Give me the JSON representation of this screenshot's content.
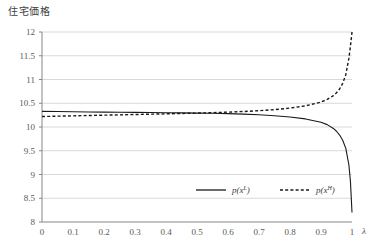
{
  "chart_data": {
    "type": "line",
    "title": "住宅価格",
    "xlabel": "λ",
    "ylabel": "",
    "xlim": [
      0,
      1
    ],
    "ylim": [
      8,
      12
    ],
    "grid": true,
    "legend_position": "inside-bottom-center",
    "x_ticks": [
      "0",
      "0.1",
      "0.2",
      "0.3",
      "0.4",
      "0.5",
      "0.6",
      "0.7",
      "0.8",
      "0.9",
      "1"
    ],
    "y_ticks": [
      "8",
      "8.5",
      "9",
      "9.5",
      "10",
      "10.5",
      "11",
      "11.5",
      "12"
    ],
    "x": [
      0,
      0.05,
      0.1,
      0.15,
      0.2,
      0.25,
      0.3,
      0.35,
      0.4,
      0.45,
      0.5,
      0.55,
      0.6,
      0.65,
      0.7,
      0.75,
      0.8,
      0.85,
      0.9,
      0.92,
      0.94,
      0.95,
      0.96,
      0.97,
      0.98,
      0.99,
      0.995,
      1
    ],
    "series": [
      {
        "name": "p(x^L)",
        "legend_base": "p(x",
        "legend_sup": "L",
        "style": "solid",
        "color": "#1a1a1a",
        "values": [
          10.33,
          10.325,
          10.32,
          10.317,
          10.313,
          10.31,
          10.307,
          10.304,
          10.3,
          10.297,
          10.293,
          10.288,
          10.282,
          10.272,
          10.258,
          10.238,
          10.21,
          10.17,
          10.1,
          10.05,
          9.97,
          9.91,
          9.83,
          9.72,
          9.55,
          9.2,
          8.85,
          8.2
        ]
      },
      {
        "name": "p(x^H)",
        "legend_base": "p(x",
        "legend_sup": "H",
        "style": "dashed",
        "color": "#1a1a1a",
        "values": [
          10.22,
          10.228,
          10.235,
          10.242,
          10.249,
          10.256,
          10.263,
          10.27,
          10.277,
          10.285,
          10.293,
          10.302,
          10.313,
          10.326,
          10.343,
          10.366,
          10.398,
          10.445,
          10.525,
          10.58,
          10.66,
          10.72,
          10.8,
          10.92,
          11.1,
          11.45,
          11.7,
          12.0
        ]
      }
    ]
  },
  "axis_colors": {
    "grid": "#d9d9d9",
    "axis_line": "#868686",
    "tick_text": "#595959"
  }
}
